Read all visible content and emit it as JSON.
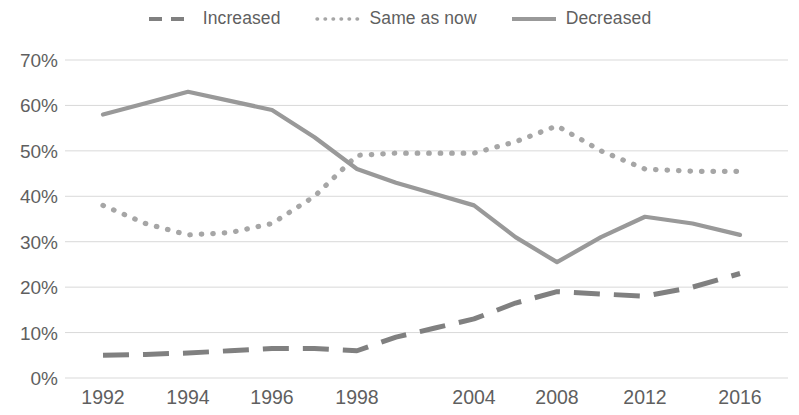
{
  "legend": {
    "position": "top-center",
    "items": [
      {
        "label": "Increased",
        "style": "dashed",
        "color": "#808080",
        "swatch": "dashed-line-swatch"
      },
      {
        "label": "Same as now",
        "style": "dotted",
        "color": "#a6a6a6",
        "swatch": "dotted-line-swatch"
      },
      {
        "label": "Decreased",
        "style": "solid",
        "color": "#999999",
        "swatch": "solid-line-swatch"
      }
    ]
  },
  "axes": {
    "y_ticks": [
      "0%",
      "10%",
      "20%",
      "30%",
      "40%",
      "50%",
      "60%",
      "70%"
    ],
    "x_ticks": [
      "1992",
      "1994",
      "1996",
      "1998",
      "2004",
      "2008",
      "2012",
      "2016"
    ]
  },
  "chart_data": {
    "type": "line",
    "title": "",
    "subtitle": "",
    "xlabel": "",
    "ylabel": "",
    "ylim": [
      0,
      70
    ],
    "yunit": "%",
    "grid": true,
    "legend_position": "top-center",
    "categories": [
      "1992",
      "1994",
      "1996",
      "1998",
      "2004",
      "2008",
      "2012",
      "2016"
    ],
    "series": [
      {
        "name": "Increased",
        "style": "dashed",
        "color": "#808080",
        "values": [
          5,
          5.5,
          6.5,
          6,
          13,
          19,
          18,
          23
        ],
        "detail_x": [
          1992,
          1993,
          1994,
          1995,
          1996,
          1997,
          1998,
          2000,
          2002,
          2004,
          2006,
          2008,
          2010,
          2012,
          2014,
          2016
        ],
        "detail_values": [
          5,
          5.2,
          5.5,
          6,
          6.5,
          6.5,
          6,
          9,
          11,
          13,
          16.5,
          19,
          18.5,
          18,
          20,
          23
        ]
      },
      {
        "name": "Same as now",
        "style": "dotted",
        "color": "#a6a6a6",
        "values": [
          38,
          31.5,
          34,
          49,
          49.5,
          55.5,
          46,
          45.5
        ],
        "detail_x": [
          1992,
          1993,
          1994,
          1995,
          1996,
          1997,
          1998,
          2000,
          2002,
          2004,
          2006,
          2008,
          2010,
          2012,
          2014,
          2016
        ],
        "detail_values": [
          38,
          34,
          31.5,
          32,
          34,
          40,
          49,
          49.5,
          49.5,
          49.5,
          52,
          55.5,
          50,
          46,
          45.5,
          45.5
        ]
      },
      {
        "name": "Decreased",
        "style": "solid",
        "color": "#999999",
        "values": [
          58,
          63,
          59,
          46,
          38,
          25.5,
          35.5,
          31.5
        ],
        "detail_x": [
          1992,
          1993,
          1994,
          1995,
          1996,
          1997,
          1998,
          2000,
          2002,
          2004,
          2006,
          2008,
          2010,
          2012,
          2014,
          2016
        ],
        "detail_values": [
          58,
          60.5,
          63,
          61,
          59,
          53,
          46,
          43,
          40.5,
          38,
          31,
          25.5,
          31,
          35.5,
          34,
          31.5
        ]
      }
    ]
  }
}
